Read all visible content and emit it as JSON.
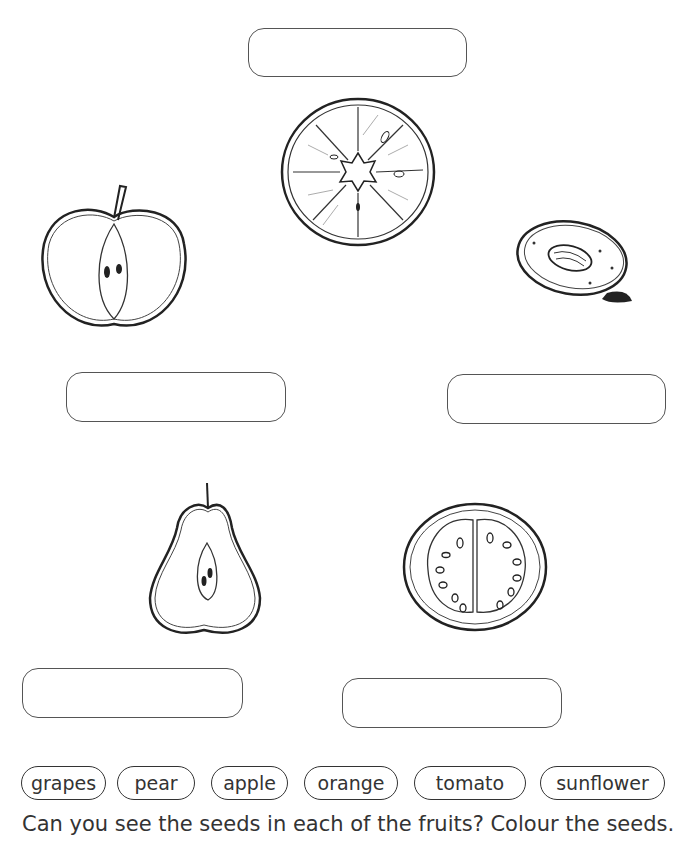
{
  "worksheet": {
    "word_bank": [
      "grapes",
      "pear",
      "apple",
      "orange",
      "tomato",
      "sunflower"
    ],
    "instruction": "Can you see the seeds in each of the fruits? Colour the seeds.",
    "label_boxes": [
      {
        "fruit": "orange",
        "value": ""
      },
      {
        "fruit": "apple",
        "value": ""
      },
      {
        "fruit": "plum",
        "value": ""
      },
      {
        "fruit": "pear",
        "value": ""
      },
      {
        "fruit": "tomato",
        "value": ""
      }
    ]
  }
}
